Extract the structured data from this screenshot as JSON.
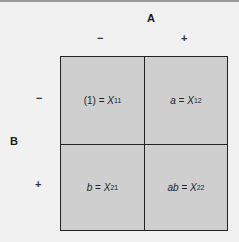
{
  "factor_a": {
    "label": "A",
    "levels": [
      "−",
      "+"
    ]
  },
  "factor_b": {
    "label": "B",
    "levels": [
      "−",
      "+"
    ]
  },
  "cells": [
    {
      "row": 0,
      "col": 0,
      "symbol": "(1)",
      "eq": " = ",
      "var": "X",
      "sub": "11"
    },
    {
      "row": 0,
      "col": 1,
      "symbol": "a",
      "eq": " = ",
      "var": "X",
      "sub": "12"
    },
    {
      "row": 1,
      "col": 0,
      "symbol": "b",
      "eq": " = ",
      "var": "X",
      "sub": "21"
    },
    {
      "row": 1,
      "col": 1,
      "symbol": "ab",
      "eq": " = ",
      "var": "X",
      "sub": "22"
    }
  ],
  "colors": {
    "cell_fill": "#cfcfcf",
    "background": "#f1f1f1",
    "border": "#222222"
  }
}
